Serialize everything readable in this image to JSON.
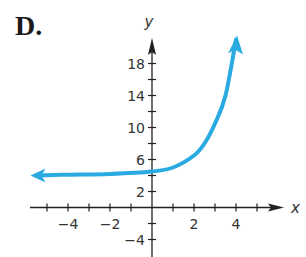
{
  "panel_label": "D.",
  "colors": {
    "curve": "#29abe2",
    "axis": "#222222"
  },
  "chart_data": {
    "type": "line",
    "title": "D.",
    "xlabel": "x",
    "ylabel": "y",
    "xlim": [
      -5.5,
      6.2
    ],
    "ylim": [
      -6,
      21
    ],
    "x_ticks": [
      -5,
      -4,
      -3,
      -2,
      -1,
      1,
      2,
      3,
      4,
      5
    ],
    "x_tick_labels": [
      "-4",
      "-2",
      "2",
      "4"
    ],
    "x_tick_label_values": [
      -4,
      -2,
      2,
      4
    ],
    "y_ticks": [
      -4,
      -2,
      2,
      4,
      6,
      8,
      10,
      12,
      14,
      16,
      18
    ],
    "y_tick_labels": [
      "18",
      "14",
      "10",
      "6",
      "2",
      "-4"
    ],
    "y_tick_label_values": [
      18,
      14,
      10,
      6,
      2,
      -4
    ],
    "grid": false,
    "legend": null,
    "series": [
      {
        "name": "exponential curve",
        "description": "exponential growth with horizontal asymptote y = 4, arrows at both ends",
        "x": [
          -5.5,
          -4,
          -2,
          0,
          1,
          2,
          2.5,
          3,
          3.5,
          4
        ],
        "y": [
          4.0,
          4.1,
          4.2,
          4.5,
          5.0,
          6.5,
          8.0,
          10.5,
          14.0,
          21.0
        ]
      }
    ]
  }
}
